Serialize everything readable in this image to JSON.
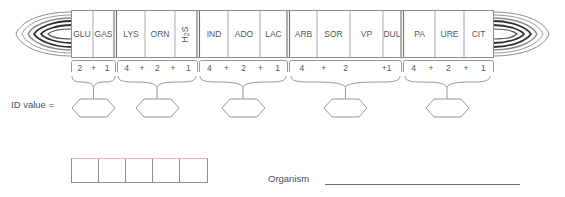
{
  "strip": {
    "cells": [
      {
        "code": "GLU",
        "rotated": false
      },
      {
        "code": "GAS",
        "rotated": false
      },
      {
        "code": "LYS",
        "rotated": false
      },
      {
        "code": "ORN",
        "rotated": false
      },
      {
        "code": "H2S",
        "rotated": true,
        "display": "H₂S"
      },
      {
        "code": "IND",
        "rotated": false
      },
      {
        "code": "ADO",
        "rotated": false
      },
      {
        "code": "LAC",
        "rotated": false
      },
      {
        "code": "ARB",
        "rotated": false
      },
      {
        "code": "SOR",
        "rotated": false
      },
      {
        "code": "VP",
        "rotated": false
      },
      {
        "code": "DUL",
        "rotated": false
      },
      {
        "code": "PA",
        "rotated": false
      },
      {
        "code": "URE",
        "rotated": false
      },
      {
        "code": "CIT",
        "rotated": false
      }
    ],
    "groups": [
      {
        "cells": [
          "GLU",
          "GAS"
        ],
        "values": [
          "2",
          "+",
          "1"
        ]
      },
      {
        "cells": [
          "LYS",
          "ORN",
          "H2S"
        ],
        "values": [
          "4",
          "+",
          "2",
          "+",
          "1"
        ]
      },
      {
        "cells": [
          "IND",
          "ADO",
          "LAC"
        ],
        "values": [
          "4",
          "+",
          "2",
          "+",
          "1"
        ]
      },
      {
        "cells": [
          "ARB",
          "SOR",
          "VP",
          "DUL"
        ],
        "values": [
          "4",
          "+",
          "2",
          "",
          "+1"
        ]
      },
      {
        "cells": [
          "PA",
          "URE",
          "CIT"
        ],
        "values": [
          "4",
          "+",
          "2",
          "+",
          "1"
        ]
      }
    ]
  },
  "id_value": {
    "label": "ID value =",
    "hexagon_count": 5,
    "hexagons": [
      "",
      "",
      "",
      "",
      ""
    ]
  },
  "code_boxes": {
    "count": 5,
    "values": [
      "",
      "",
      "",
      "",
      ""
    ],
    "top_border_color": "#f2b3b7",
    "border_color": "#8d8d8d"
  },
  "organism": {
    "label": "Organism",
    "value": ""
  },
  "colors": {
    "line": "#8d8d8d",
    "text": "#555555",
    "accent_pink": "#f2b3b7"
  }
}
